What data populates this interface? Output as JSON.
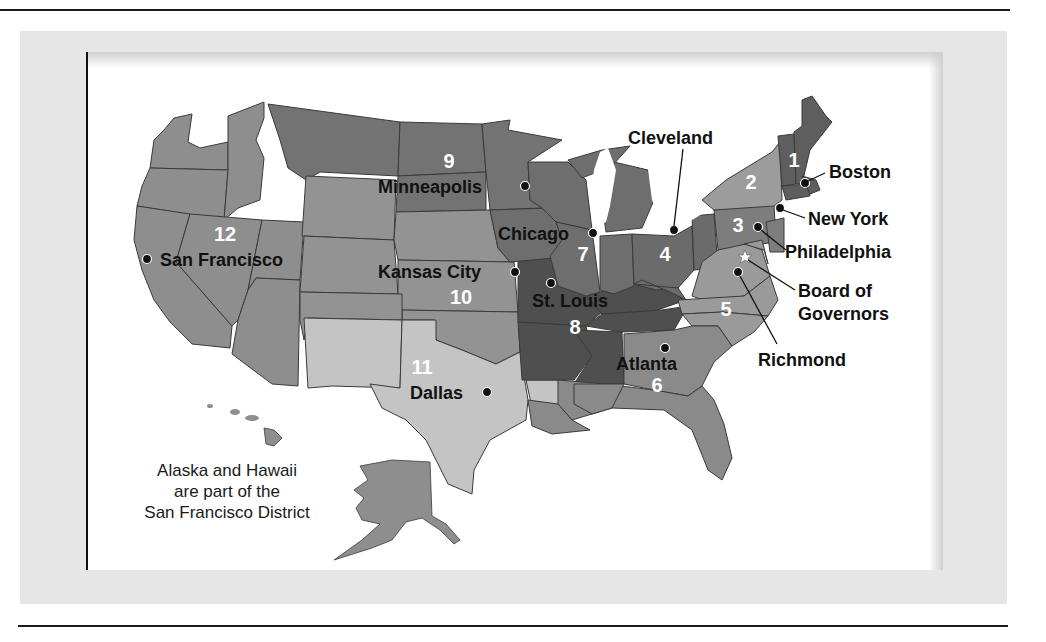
{
  "map": {
    "subject": "Federal Reserve Districts",
    "colors": {
      "d1": "#5e5e5e",
      "d2": "#9c9c9c",
      "d3": "#7d7d7d",
      "d4": "#6b6b6b",
      "d5": "#9a9a9a",
      "d6": "#8a8a8a",
      "d7": "#6e6e6e",
      "d8": "#4f4f4f",
      "d9": "#737373",
      "d10": "#939393",
      "d11": "#c4c4c4",
      "d12": "#8e8e8e",
      "panel": "#e6e6e6",
      "frame": "#ffffff",
      "dot": "#111111"
    },
    "districts": [
      {
        "number": "1",
        "city": "Boston"
      },
      {
        "number": "2",
        "city": "New York"
      },
      {
        "number": "3",
        "city": "Philadelphia"
      },
      {
        "number": "4",
        "city": "Cleveland"
      },
      {
        "number": "5",
        "city": "Richmond"
      },
      {
        "number": "6",
        "city": "Atlanta"
      },
      {
        "number": "7",
        "city": "Chicago"
      },
      {
        "number": "8",
        "city": "St. Louis"
      },
      {
        "number": "9",
        "city": "Minneapolis"
      },
      {
        "number": "10",
        "city": "Kansas City"
      },
      {
        "number": "11",
        "city": "Dallas"
      },
      {
        "number": "12",
        "city": "San Francisco"
      }
    ],
    "board": {
      "line1": "Board of",
      "line2": "Governors",
      "marker": "star-icon"
    },
    "note": {
      "line1": "Alaska and Hawaii",
      "line2": "are part of the",
      "line3": "San Francisco District"
    }
  }
}
